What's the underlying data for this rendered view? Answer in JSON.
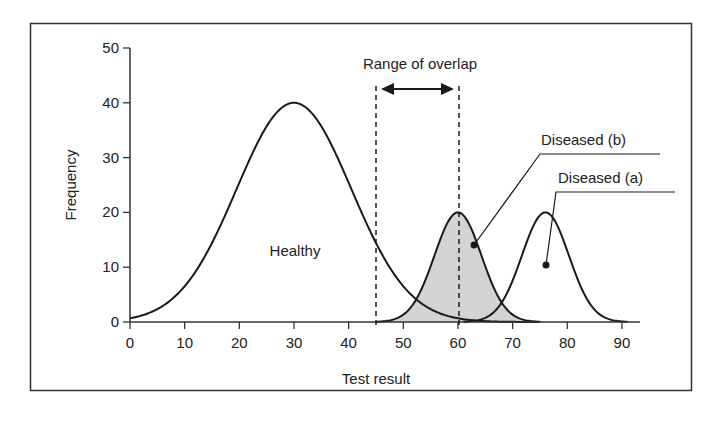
{
  "chart_data": {
    "type": "line",
    "title": "",
    "xlabel": "Test result",
    "ylabel": "Frequency",
    "xlim": [
      0,
      92
    ],
    "ylim": [
      0,
      50
    ],
    "xticks": [
      0,
      10,
      20,
      30,
      40,
      50,
      60,
      70,
      80,
      90
    ],
    "yticks": [
      0,
      10,
      20,
      30,
      40,
      50
    ],
    "grid": false,
    "legend": "none (inline labels)",
    "series": [
      {
        "name": "Healthy",
        "shape": "gaussian",
        "mean": 30,
        "peak": 40,
        "range": [
          0,
          75
        ],
        "fill": "none"
      },
      {
        "name": "Diseased (b)",
        "shape": "gaussian",
        "mean": 60,
        "peak": 20,
        "range": [
          45,
          75
        ],
        "fill": "#d3d3d3"
      },
      {
        "name": "Diseased (a)",
        "shape": "gaussian",
        "mean": 76,
        "peak": 20,
        "range": [
          61,
          91
        ],
        "fill": "none"
      }
    ],
    "annotations": [
      {
        "text": "Range of overlap",
        "type": "double-arrow",
        "from": 45,
        "to": 60
      },
      {
        "type": "dashed-vline",
        "x": 45
      },
      {
        "type": "dashed-vline",
        "x": 60
      },
      {
        "text": "Healthy",
        "x": 29,
        "y": 13
      },
      {
        "text": "Diseased (b)",
        "pointer_to": [
          63,
          14
        ]
      },
      {
        "text": "Diseased (a)",
        "pointer_to": [
          76,
          10.5
        ]
      }
    ]
  },
  "labels": {
    "xlabel": "Test result",
    "ylabel": "Frequency",
    "overlap": "Range of overlap",
    "healthy": "Healthy",
    "diseased_b": "Diseased (b)",
    "diseased_a": "Diseased (a)",
    "xticks": [
      "0",
      "10",
      "20",
      "30",
      "40",
      "50",
      "60",
      "70",
      "80",
      "90"
    ],
    "yticks": [
      "0",
      "10",
      "20",
      "30",
      "40",
      "50"
    ]
  },
  "colors": {
    "line": "#1a1a1a",
    "shade": "#d3d3d3",
    "frame": "#333333"
  }
}
